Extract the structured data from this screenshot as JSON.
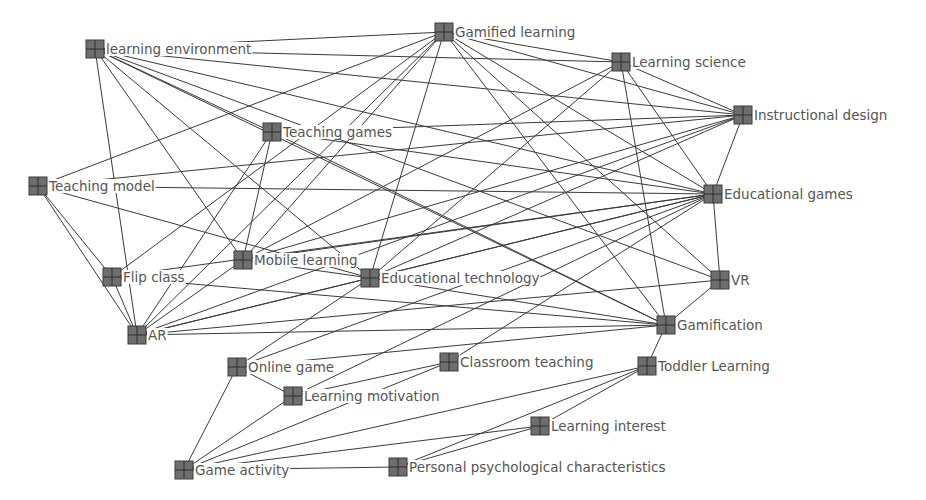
{
  "diagram": {
    "type": "keyword co-occurrence network",
    "node_color": "#6e6e6e",
    "edge_color": "#3a3a3a",
    "label_color": "#555555",
    "nodes": [
      {
        "id": "gamified_learning",
        "label": "Gamified learning"
      },
      {
        "id": "learning_environment",
        "label": "learning environment"
      },
      {
        "id": "learning_science",
        "label": "Learning science"
      },
      {
        "id": "instructional_design",
        "label": "Instructional design"
      },
      {
        "id": "teaching_games",
        "label": "Teaching games"
      },
      {
        "id": "teaching_model",
        "label": "Teaching model"
      },
      {
        "id": "educational_games",
        "label": "Educational games"
      },
      {
        "id": "mobile_learning",
        "label": "Mobile learning"
      },
      {
        "id": "flip_class",
        "label": "Flip class"
      },
      {
        "id": "educational_technology",
        "label": "Educational technology"
      },
      {
        "id": "vr",
        "label": "VR"
      },
      {
        "id": "ar",
        "label": "AR"
      },
      {
        "id": "gamification",
        "label": "Gamification"
      },
      {
        "id": "online_game",
        "label": "Online game"
      },
      {
        "id": "classroom_teaching",
        "label": "Classroom teaching"
      },
      {
        "id": "toddler_learning",
        "label": "Toddler Learning"
      },
      {
        "id": "learning_motivation",
        "label": "Learning motivation"
      },
      {
        "id": "learning_interest",
        "label": "Learning interest"
      },
      {
        "id": "game_activity",
        "label": "Game activity"
      },
      {
        "id": "personal_psych",
        "label": "Personal psychological characteristics"
      }
    ],
    "edges": [
      [
        "learning_environment",
        "gamified_learning"
      ],
      [
        "learning_environment",
        "learning_science"
      ],
      [
        "learning_environment",
        "instructional_design"
      ],
      [
        "learning_environment",
        "educational_games"
      ],
      [
        "learning_environment",
        "teaching_games"
      ],
      [
        "learning_environment",
        "mobile_learning"
      ],
      [
        "learning_environment",
        "educational_technology"
      ],
      [
        "learning_environment",
        "ar"
      ],
      [
        "learning_environment",
        "gamification"
      ],
      [
        "learning_environment",
        "vr"
      ],
      [
        "gamified_learning",
        "learning_science"
      ],
      [
        "gamified_learning",
        "instructional_design"
      ],
      [
        "gamified_learning",
        "educational_games"
      ],
      [
        "gamified_learning",
        "teaching_model"
      ],
      [
        "gamified_learning",
        "mobile_learning"
      ],
      [
        "gamified_learning",
        "flip_class"
      ],
      [
        "gamified_learning",
        "educational_technology"
      ],
      [
        "gamified_learning",
        "ar"
      ],
      [
        "gamified_learning",
        "gamification"
      ],
      [
        "gamified_learning",
        "vr"
      ],
      [
        "learning_science",
        "instructional_design"
      ],
      [
        "learning_science",
        "educational_games"
      ],
      [
        "learning_science",
        "gamification"
      ],
      [
        "learning_science",
        "mobile_learning"
      ],
      [
        "learning_science",
        "educational_technology"
      ],
      [
        "instructional_design",
        "educational_games"
      ],
      [
        "instructional_design",
        "teaching_games"
      ],
      [
        "instructional_design",
        "teaching_model"
      ],
      [
        "instructional_design",
        "mobile_learning"
      ],
      [
        "instructional_design",
        "ar"
      ],
      [
        "instructional_design",
        "educational_technology"
      ],
      [
        "teaching_games",
        "mobile_learning"
      ],
      [
        "teaching_games",
        "educational_games"
      ],
      [
        "teaching_games",
        "gamification"
      ],
      [
        "teaching_games",
        "ar"
      ],
      [
        "teaching_model",
        "educational_games"
      ],
      [
        "teaching_model",
        "flip_class"
      ],
      [
        "teaching_model",
        "ar"
      ],
      [
        "teaching_model",
        "educational_technology"
      ],
      [
        "educational_games",
        "vr"
      ],
      [
        "educational_games",
        "mobile_learning"
      ],
      [
        "educational_games",
        "educational_technology"
      ],
      [
        "educational_games",
        "ar"
      ],
      [
        "educational_games",
        "online_game"
      ],
      [
        "educational_games",
        "classroom_teaching"
      ],
      [
        "educational_games",
        "learning_motivation"
      ],
      [
        "educational_games",
        "flip_class"
      ],
      [
        "mobile_learning",
        "educational_technology"
      ],
      [
        "mobile_learning",
        "ar"
      ],
      [
        "flip_class",
        "ar"
      ],
      [
        "flip_class",
        "gamification"
      ],
      [
        "educational_technology",
        "ar"
      ],
      [
        "educational_technology",
        "gamification"
      ],
      [
        "educational_technology",
        "online_game"
      ],
      [
        "vr",
        "gamification"
      ],
      [
        "vr",
        "ar"
      ],
      [
        "ar",
        "gamification"
      ],
      [
        "gamification",
        "toddler_learning"
      ],
      [
        "gamification",
        "online_game"
      ],
      [
        "online_game",
        "learning_motivation"
      ],
      [
        "online_game",
        "game_activity"
      ],
      [
        "classroom_teaching",
        "learning_motivation"
      ],
      [
        "learning_motivation",
        "game_activity"
      ],
      [
        "toddler_learning",
        "game_activity"
      ],
      [
        "toddler_learning",
        "personal_psych"
      ],
      [
        "toddler_learning",
        "learning_interest"
      ],
      [
        "learning_interest",
        "game_activity"
      ],
      [
        "learning_interest",
        "personal_psych"
      ],
      [
        "game_activity",
        "personal_psych"
      ],
      [
        "game_activity",
        "classroom_teaching"
      ]
    ]
  }
}
